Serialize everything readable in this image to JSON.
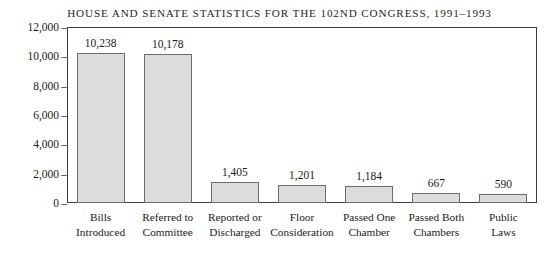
{
  "chart_data": {
    "type": "bar",
    "title": "HOUSE AND SENATE STATISTICS FOR THE 102ND CONGRESS, 1991–1993",
    "xlabel": "",
    "ylabel": "",
    "ylim": [
      0,
      12000
    ],
    "grid": false,
    "legend": false,
    "categories": [
      "Bills Introduced",
      "Referred to Committee",
      "Reported or Discharged",
      "Floor Consideration",
      "Passed One Chamber",
      "Passed Both Chambers",
      "Public Laws"
    ],
    "category_lines": [
      [
        "Bills",
        "Introduced"
      ],
      [
        "Referred to",
        "Committee"
      ],
      [
        "Reported or",
        "Discharged"
      ],
      [
        "Floor",
        "Consideration"
      ],
      [
        "Passed One",
        "Chamber"
      ],
      [
        "Passed Both",
        "Chambers"
      ],
      [
        "Public",
        "Laws"
      ]
    ],
    "values": [
      10238,
      10178,
      1405,
      1201,
      1184,
      667,
      590
    ],
    "value_labels": [
      "10,238",
      "10,178",
      "1,405",
      "1,201",
      "1,184",
      "667",
      "590"
    ],
    "y_ticks": [
      12000,
      10000,
      8000,
      6000,
      4000,
      2000,
      0
    ],
    "y_tick_labels": [
      "12,000",
      "10,000",
      "8,000",
      "6,000",
      "4,000",
      "2,000",
      "0"
    ],
    "y_tick_dash": "–",
    "colors": {
      "bar_fill": "#dcdcdc",
      "bar_border": "#6e6e6e",
      "frame": "#3d3d3d",
      "text": "#1a1a1a",
      "background": "#ffffff"
    }
  }
}
